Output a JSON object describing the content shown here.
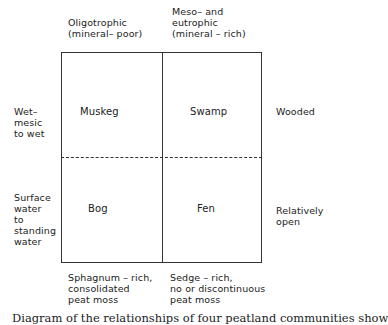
{
  "diagram": {
    "columns": [
      {
        "header": "Oligotrophic\n(mineral– poor)",
        "footer": "Sphagnum – rich,\nconsolidated\npeat moss"
      },
      {
        "header": "Meso– and\neutrophic\n(mineral – rich)",
        "footer": "Sedge – rich,\nno or discontinuous\npeat moss"
      }
    ],
    "rows": [
      {
        "left_label": "Wet–\nmesic\nto wet",
        "right_label": "Wooded"
      },
      {
        "left_label": "Surface\nwater\nto\nstanding\nwater",
        "right_label": "Relatively\nopen"
      }
    ],
    "cells": {
      "top_left": "Muskeg",
      "top_right": "Swamp",
      "bottom_left": "Bog",
      "bottom_right": "Fen"
    },
    "caption": "Diagram of the relationships of four peatland communities show"
  }
}
